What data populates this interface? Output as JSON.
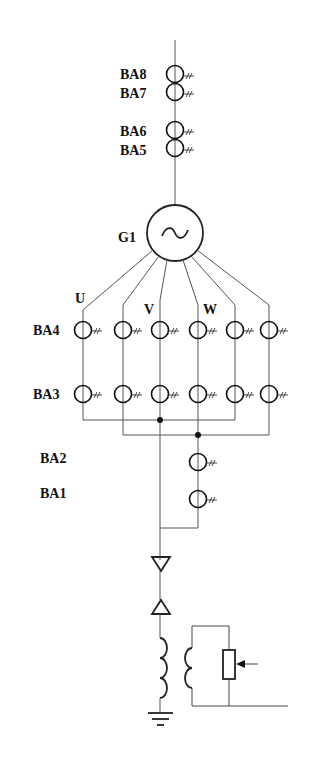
{
  "diagram": {
    "title": "",
    "generator": {
      "label": "G1",
      "symbol": "~"
    },
    "phase_labels": {
      "u": "U",
      "v": "V",
      "w": "W"
    },
    "current_transformers": {
      "ba8": "BA8",
      "ba7": "BA7",
      "ba6": "BA6",
      "ba5": "BA5",
      "ba4": "BA4",
      "ba3": "BA3",
      "ba2": "BA2",
      "ba1": "BA1"
    },
    "ct_columns": 6,
    "secondary_mark": "#",
    "components": [
      "main-conductor",
      "current-transformers-BA8-BA5",
      "generator-G1",
      "six-phase-branches",
      "current-transformer-rows-BA4-BA3",
      "neutral-busbars",
      "current-transformers-BA2-BA1",
      "arrester-down",
      "arrester-up",
      "grounding-transformer",
      "adjustable-resistor",
      "earth-ground"
    ],
    "colors": {
      "line": "#555555",
      "symbol": "#111111",
      "background": "#ffffff"
    }
  }
}
